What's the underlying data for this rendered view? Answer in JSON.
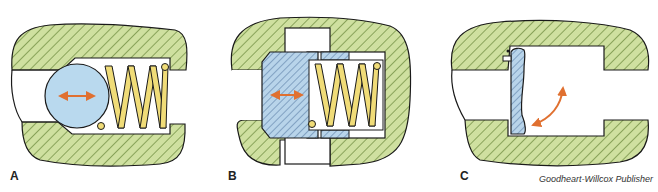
{
  "figure": {
    "panels": [
      {
        "label": "A",
        "component": "ball check valve",
        "parts": [
          "body",
          "ball",
          "spring"
        ]
      },
      {
        "label": "B",
        "component": "poppet check valve",
        "parts": [
          "body",
          "poppet",
          "spring"
        ]
      },
      {
        "label": "C",
        "component": "swing check valve",
        "parts": [
          "body",
          "hinged disc"
        ]
      }
    ],
    "credit": "Goodheart-Willcox Publisher",
    "colors": {
      "body_fill": "#cfe0a0",
      "hatch": "#5a7a2a",
      "ball_fill": "#b9d9ee",
      "spring_fill": "#f0dc78",
      "poppet_fill": "#b8d4ea",
      "poppet_hatch": "#4a6f9a",
      "arrow": "#e07030",
      "outline": "#1a1a1a"
    }
  }
}
